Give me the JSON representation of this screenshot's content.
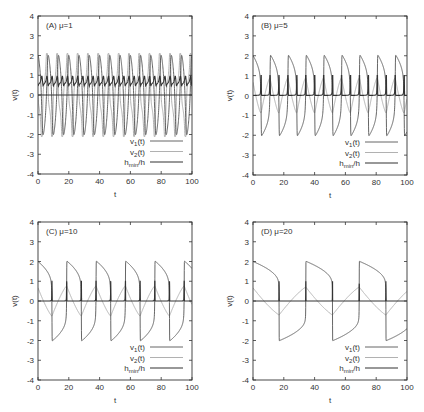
{
  "chart_data": [
    {
      "type": "line",
      "panel": "A",
      "title": "(A) μ=1",
      "xlabel": "t",
      "ylabel": "v(t)",
      "xlim": [
        0,
        100
      ],
      "ylim": [
        -4,
        4
      ],
      "xticks": [
        0,
        20,
        40,
        60,
        80,
        100
      ],
      "yticks": [
        -4,
        -3,
        -2,
        -1,
        0,
        1,
        2,
        3,
        4
      ],
      "grid": false,
      "legend_position": "lower right",
      "series": [
        {
          "name": "v1(t)",
          "label_main": "v",
          "label_sub": "1",
          "label_tail": "(t)",
          "color": "#555555",
          "width": 0.9,
          "amplitude": 2.0,
          "period": 6.6,
          "shape": "relaxation",
          "mu": 1
        },
        {
          "name": "v2(t)",
          "label_main": "v",
          "label_sub": "2",
          "label_tail": "(t)",
          "color": "#a8a8a8",
          "width": 0.9,
          "amplitude": 2.0,
          "period": 6.6,
          "shape": "derivative",
          "mu": 1
        },
        {
          "name": "hmin/h",
          "label_main": "h",
          "label_sub": "min",
          "label_tail": "/h",
          "color": "#333333",
          "width": 1.1,
          "baseline": 0.0,
          "spike_min": 0.45,
          "spike_max": 0.95,
          "period": 6.6,
          "shape": "step-ratio",
          "mu": 1
        }
      ]
    },
    {
      "type": "line",
      "panel": "B",
      "title": "(B) μ=5",
      "xlabel": "t",
      "ylabel": "v(t)",
      "xlim": [
        0,
        100
      ],
      "ylim": [
        -4,
        4
      ],
      "xticks": [
        0,
        20,
        40,
        60,
        80,
        100
      ],
      "yticks": [
        -4,
        -3,
        -2,
        -1,
        0,
        1,
        2,
        3,
        4
      ],
      "grid": false,
      "legend_position": "lower right",
      "series": [
        {
          "name": "v1(t)",
          "label_main": "v",
          "label_sub": "1",
          "label_tail": "(t)",
          "color": "#555555",
          "width": 0.9,
          "amplitude": 2.0,
          "period": 11.6,
          "shape": "relaxation",
          "mu": 5
        },
        {
          "name": "v2(t)",
          "label_main": "v",
          "label_sub": "2",
          "label_tail": "(t)",
          "color": "#a8a8a8",
          "width": 0.9,
          "amplitude": 0.7,
          "period": 11.6,
          "shape": "derivative",
          "mu": 5
        },
        {
          "name": "hmin/h",
          "label_main": "h",
          "label_sub": "min",
          "label_tail": "/h",
          "color": "#333333",
          "width": 1.1,
          "baseline": 0.0,
          "spike_max": 1.0,
          "period": 11.6,
          "shape": "spikes",
          "mu": 5
        }
      ]
    },
    {
      "type": "line",
      "panel": "C",
      "title": "(C) μ=10",
      "xlabel": "t",
      "ylabel": "v(t)",
      "xlim": [
        0,
        100
      ],
      "ylim": [
        -4,
        4
      ],
      "xticks": [
        0,
        20,
        40,
        60,
        80,
        100
      ],
      "yticks": [
        -4,
        -3,
        -2,
        -1,
        0,
        1,
        2,
        3,
        4
      ],
      "grid": false,
      "legend_position": "lower right",
      "series": [
        {
          "name": "v1(t)",
          "label_main": "v",
          "label_sub": "1",
          "label_tail": "(t)",
          "color": "#555555",
          "width": 0.9,
          "amplitude": 2.0,
          "period": 19.2,
          "shape": "relaxation",
          "mu": 10
        },
        {
          "name": "v2(t)",
          "label_main": "v",
          "label_sub": "2",
          "label_tail": "(t)",
          "color": "#a8a8a8",
          "width": 0.9,
          "amplitude": 0.7,
          "period": 19.2,
          "shape": "derivative",
          "mu": 10
        },
        {
          "name": "hmin/h",
          "label_main": "h",
          "label_sub": "min",
          "label_tail": "/h",
          "color": "#333333",
          "width": 1.1,
          "baseline": 0.0,
          "spike_max": 1.0,
          "period": 19.2,
          "shape": "spikes",
          "mu": 10
        }
      ]
    },
    {
      "type": "line",
      "panel": "D",
      "title": "(D) μ=20",
      "xlabel": "t",
      "ylabel": "v(t)",
      "xlim": [
        0,
        100
      ],
      "ylim": [
        -4,
        4
      ],
      "xticks": [
        0,
        20,
        40,
        60,
        80,
        100
      ],
      "yticks": [
        -4,
        -3,
        -2,
        -1,
        0,
        1,
        2,
        3,
        4
      ],
      "grid": false,
      "legend_position": "lower right",
      "series": [
        {
          "name": "v1(t)",
          "label_main": "v",
          "label_sub": "1",
          "label_tail": "(t)",
          "color": "#555555",
          "width": 0.9,
          "amplitude": 2.0,
          "period": 34.6,
          "shape": "relaxation",
          "mu": 20
        },
        {
          "name": "v2(t)",
          "label_main": "v",
          "label_sub": "2",
          "label_tail": "(t)",
          "color": "#a8a8a8",
          "width": 0.9,
          "amplitude": 0.7,
          "period": 34.6,
          "shape": "derivative",
          "mu": 20
        },
        {
          "name": "hmin/h",
          "label_main": "h",
          "label_sub": "min",
          "label_tail": "/h",
          "color": "#333333",
          "width": 1.1,
          "baseline": 0.0,
          "spike_max": 1.0,
          "period": 34.6,
          "shape": "spikes",
          "mu": 20
        }
      ]
    }
  ],
  "layout": {
    "panels": [
      {
        "left": 38,
        "top": 16,
        "width": 154,
        "height": 158
      },
      {
        "left": 253,
        "top": 16,
        "width": 154,
        "height": 159
      },
      {
        "left": 38,
        "top": 222,
        "width": 154,
        "height": 158
      },
      {
        "left": 253,
        "top": 222,
        "width": 154,
        "height": 158
      }
    ],
    "axis_color": "#333333"
  }
}
